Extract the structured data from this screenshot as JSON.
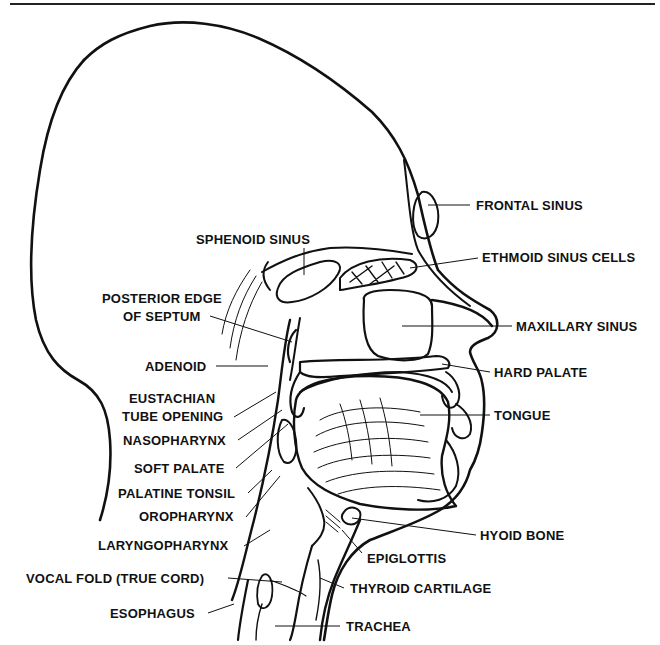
{
  "diagram": {
    "labels": {
      "frontal_sinus": "FRONTAL SINUS",
      "sphenoid_sinus": "SPHENOID SINUS",
      "ethmoid_sinus_cells": "ETHMOID SINUS CELLS",
      "posterior_edge_line1": "POSTERIOR EDGE",
      "posterior_edge_line2": "OF SEPTUM",
      "maxillary_sinus": "MAXILLARY SINUS",
      "adenoid": "ADENOID",
      "hard_palate": "HARD PALATE",
      "eustachian_line1": "EUSTACHIAN",
      "eustachian_line2": "TUBE OPENING",
      "tongue": "TONGUE",
      "nasopharynx": "NASOPHARYNX",
      "soft_palate": "SOFT PALATE",
      "palatine_tonsil": "PALATINE TONSIL",
      "oropharynx": "OROPHARYNX",
      "hyoid_bone": "HYOID BONE",
      "laryngopharynx": "LARYNGOPHARYNX",
      "epiglottis": "EPIGLOTTIS",
      "vocal_fold": "VOCAL FOLD (TRUE CORD)",
      "thyroid_cartilage": "THYROID CARTILAGE",
      "esophagus": "ESOPHAGUS",
      "trachea": "TRACHEA"
    },
    "colors": {
      "ink": "#111111",
      "paper": "#ffffff"
    }
  }
}
